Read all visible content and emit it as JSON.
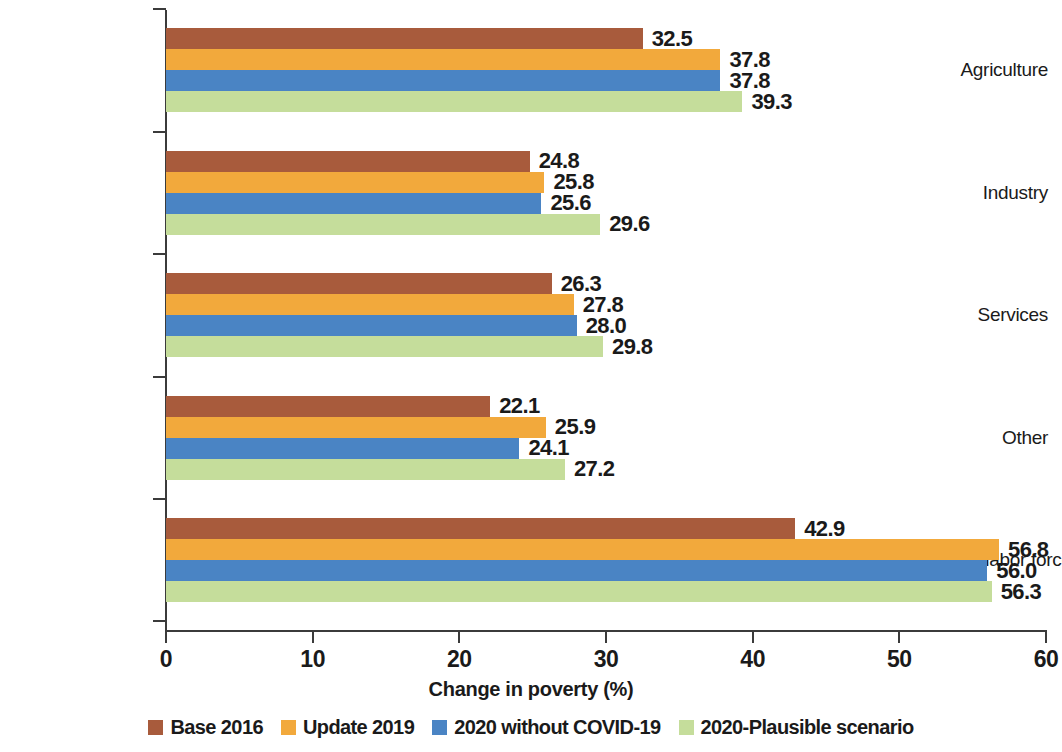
{
  "chart_data": {
    "type": "bar",
    "orientation": "horizontal",
    "title": "",
    "xlabel": "Change in poverty (%)",
    "ylabel": "",
    "xlim": [
      0,
      60
    ],
    "xticks": [
      0,
      10,
      20,
      30,
      40,
      50,
      60
    ],
    "xtick_labels": [
      "0",
      "10",
      "20",
      "30",
      "40",
      "50",
      "60"
    ],
    "grid": false,
    "legend_position": "bottom",
    "categories": [
      "Agriculture",
      "Industry",
      "Services",
      "Other",
      "Not in the labor force"
    ],
    "series": [
      {
        "name": "Base 2016",
        "color": "#a85b3c",
        "values": [
          32.5,
          24.8,
          26.3,
          22.1,
          42.9
        ],
        "value_labels": [
          "32.5",
          "24.8",
          "26.3",
          "22.1",
          "42.9"
        ]
      },
      {
        "name": "Update 2019",
        "color": "#f2a93c",
        "values": [
          37.8,
          25.8,
          27.8,
          25.9,
          56.8
        ],
        "value_labels": [
          "37.8",
          "25.8",
          "27.8",
          "25.9",
          "56.8"
        ]
      },
      {
        "name": "2020 without COVID-19",
        "color": "#4a84c4",
        "values": [
          37.8,
          25.6,
          28.0,
          24.1,
          56.0
        ],
        "value_labels": [
          "37.8",
          "25.6",
          "28.0",
          "24.1",
          "56.0"
        ]
      },
      {
        "name": "2020-Plausible scenario",
        "color": "#c5dd9b",
        "values": [
          39.3,
          29.6,
          29.8,
          27.2,
          56.3
        ],
        "value_labels": [
          "39.3",
          "29.6",
          "29.8",
          "27.2",
          "56.3"
        ]
      }
    ]
  },
  "legend": {
    "items": [
      {
        "label": "Base 2016",
        "color": "#a85b3c"
      },
      {
        "label": "Update 2019",
        "color": "#f2a93c"
      },
      {
        "label": "2020 without COVID-19",
        "color": "#4a84c4"
      },
      {
        "label": "2020-Plausible scenario",
        "color": "#c5dd9b"
      }
    ]
  },
  "axis": {
    "x_title": "Change in poverty (%)"
  }
}
